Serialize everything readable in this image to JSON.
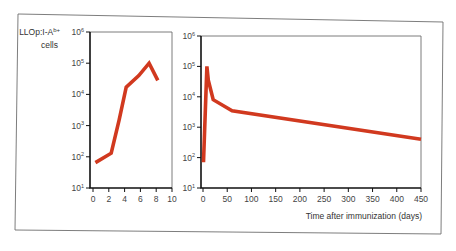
{
  "figure": {
    "ylabel_line1": "LLOp:I-A",
    "ylabel_sup": "b+",
    "ylabel_line2": "cells",
    "xlabel": "Time after immunization (days)",
    "line_color": "#d1391f",
    "frame_color": "#6e6e6e"
  },
  "chart_data": [
    {
      "type": "line",
      "title": "",
      "xlabel": "",
      "ylabel": "LLOp:I-Ab+ cells",
      "yscale": "log",
      "ylim": [
        10,
        1000000
      ],
      "xlim": [
        0,
        10
      ],
      "x_ticks": [
        "0",
        "2",
        "4",
        "6",
        "8",
        "10"
      ],
      "y_ticks": [
        {
          "base": "10",
          "exp": "1"
        },
        {
          "base": "10",
          "exp": "2"
        },
        {
          "base": "10",
          "exp": "3"
        },
        {
          "base": "10",
          "exp": "4"
        },
        {
          "base": "10",
          "exp": "5"
        },
        {
          "base": "10",
          "exp": "6"
        }
      ],
      "grid": false,
      "series": [
        {
          "name": "LLOp:I-Ab+ cells (early)",
          "x": [
            0.3,
            2.3,
            3.3,
            4.2,
            5.8,
            7.1,
            8.2
          ],
          "y": [
            65,
            130,
            1500,
            17000,
            40000,
            100000,
            28000
          ]
        }
      ]
    },
    {
      "type": "line",
      "title": "",
      "xlabel": "Time after immunization (days)",
      "ylabel": "",
      "yscale": "log",
      "ylim": [
        10,
        1000000
      ],
      "xlim": [
        0,
        450
      ],
      "x_ticks": [
        "0",
        "50",
        "100",
        "150",
        "200",
        "250",
        "300",
        "350",
        "400",
        "450"
      ],
      "y_ticks": [
        {
          "base": "10",
          "exp": "1"
        },
        {
          "base": "10",
          "exp": "2"
        },
        {
          "base": "10",
          "exp": "3"
        },
        {
          "base": "10",
          "exp": "4"
        },
        {
          "base": "10",
          "exp": "5"
        },
        {
          "base": "10",
          "exp": "6"
        }
      ],
      "grid": false,
      "series": [
        {
          "name": "LLOp:I-Ab+ cells (long-term)",
          "x": [
            1,
            8,
            11,
            21,
            60,
            450
          ],
          "y": [
            70,
            100000,
            35000,
            8000,
            3500,
            400
          ]
        }
      ]
    }
  ]
}
